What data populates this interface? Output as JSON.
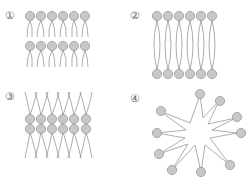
{
  "diagrams": [
    {
      "id": 1,
      "label": "①",
      "description": "Two stacked monolayers, heads up, tails down"
    },
    {
      "id": 2,
      "label": "②",
      "description": "Bilayer with heads facing outward, tails joined in middle"
    },
    {
      "id": 3,
      "label": "③",
      "description": "Bilayer with heads in middle, tails outward"
    },
    {
      "id": 4,
      "label": "④",
      "description": "Micelle-like star with heads outward"
    }
  ],
  "colors": {
    "head_fill": "#c8c8c8",
    "head_stroke": "#999999",
    "tail_stroke": "#8a8a8a",
    "label": "#666666"
  }
}
